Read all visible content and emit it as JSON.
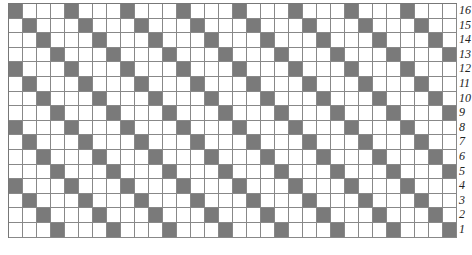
{
  "diagram": {
    "type": "weave-draft-grid",
    "columns": 32,
    "rows": 16,
    "row_labels_top_to_bottom": [
      "16",
      "15",
      "14",
      "13",
      "12",
      "11",
      "10",
      "9",
      "8",
      "7",
      "6",
      "5",
      "4",
      "3",
      "2",
      "1"
    ],
    "pattern": "twill-diagonal",
    "period": 4,
    "rule": "cell at (row_from_top r, col c) is filled when (c - r) mod 4 == 0",
    "colors": {
      "filled": "#7a7a7a",
      "empty": "#ffffff",
      "gridline": "#888888"
    }
  }
}
